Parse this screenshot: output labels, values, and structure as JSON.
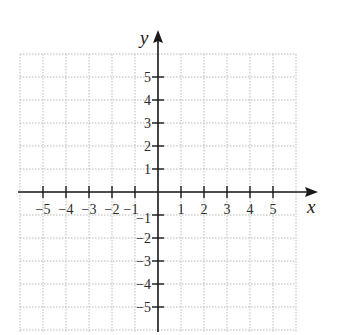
{
  "diagram": {
    "type": "coordinate-plane",
    "axes": {
      "x_label": "x",
      "y_label": "y",
      "x_range": [
        -6,
        6
      ],
      "y_range": [
        -6,
        6
      ],
      "x_ticks": [
        -5,
        -4,
        -3,
        -2,
        -1,
        1,
        2,
        3,
        4,
        5
      ],
      "y_ticks": [
        -5,
        -4,
        -3,
        -2,
        -1,
        1,
        2,
        3,
        4,
        5
      ],
      "x_tick_labels": [
        "−5",
        "−4",
        "−3",
        "−2",
        "−1",
        "1",
        "2",
        "3",
        "4",
        "5"
      ],
      "y_tick_labels": [
        "−5",
        "−4",
        "−3",
        "−2",
        "−1",
        "1",
        "2",
        "3",
        "4",
        "5"
      ]
    },
    "grid": {
      "style": "dotted",
      "spacing_units": 1,
      "color": "#b8b8b8"
    },
    "axis_color": "#1a1a1a"
  }
}
